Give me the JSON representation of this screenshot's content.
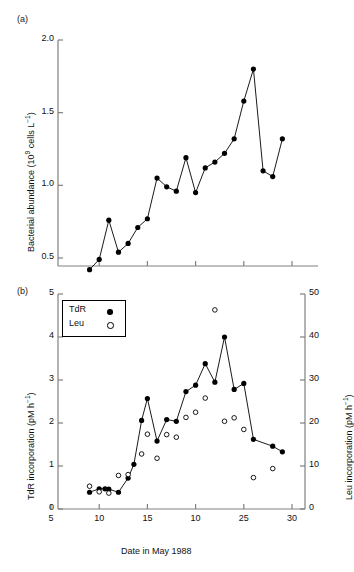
{
  "figure": {
    "panels": [
      {
        "id": "a",
        "label": "(a)"
      },
      {
        "id": "b",
        "label": "(b)"
      }
    ]
  },
  "panel_a": {
    "label": "(a)",
    "ylabel_main": "Bacterial abundance (10",
    "ylabel_exp": "9",
    "ylabel_tail": " cells L",
    "ylabel_tail_exp": "−1",
    "ylabel_close": ")",
    "yticks": [
      "0.5",
      "1.0",
      "1.5",
      "2.0"
    ]
  },
  "panel_b": {
    "label": "(b)",
    "ylabel_left_main": "TdR incorporation (pM h",
    "ylabel_left_exp": "−1",
    "ylabel_left_close": ")",
    "ylabel_right_main": "Leu incorporation (pM h",
    "ylabel_right_exp": "−1",
    "ylabel_right_close": ")",
    "xlabel": "Date in May 1988",
    "yticks_left": [
      "0",
      "1",
      "2",
      "3",
      "4",
      "5"
    ],
    "yticks_right": [
      "0",
      "10",
      "20",
      "30",
      "40",
      "50"
    ],
    "xticks": [
      "5",
      "10",
      "15",
      "10",
      "25",
      "30"
    ],
    "legend": {
      "entries": [
        {
          "label": "TdR",
          "marker": "filled-circle"
        },
        {
          "label": "Leu",
          "marker": "open-circle"
        }
      ]
    }
  },
  "chart_data": [
    {
      "type": "line",
      "panel": "a",
      "title": "",
      "xlabel": "",
      "ylabel": "Bacterial abundance (10^9 cells L^-1)",
      "xlim": [
        5,
        31
      ],
      "ylim": [
        0.38,
        2.0
      ],
      "yticks": [
        0.5,
        1.0,
        1.5,
        2.0
      ],
      "grid": false,
      "legend": "none",
      "marker": "filled-circle",
      "series": [
        {
          "name": "Bacterial abundance",
          "x": [
            9,
            10,
            11,
            12,
            13,
            14,
            15,
            16,
            17,
            18,
            19,
            20,
            21,
            22,
            23,
            24,
            25,
            26,
            27,
            28,
            29,
            30
          ],
          "y": [
            0.42,
            0.49,
            0.76,
            0.54,
            0.6,
            0.71,
            0.77,
            1.05,
            0.99,
            0.96,
            1.19,
            0.95,
            1.12,
            1.16,
            1.22,
            1.32,
            1.58,
            1.8,
            1.1,
            1.06,
            1.32
          ]
        }
      ]
    },
    {
      "type": "line",
      "panel": "b",
      "title": "",
      "xlabel": "Date in May 1988",
      "ylabel": "TdR incorporation (pM h^-1)",
      "ylabel_right": "Leu incorporation (pM h^-1)",
      "xlim": [
        5,
        31
      ],
      "ylim": [
        0,
        5
      ],
      "ylim_right": [
        0,
        50
      ],
      "yticks": [
        0,
        1,
        2,
        3,
        4,
        5
      ],
      "yticks_right": [
        0,
        10,
        20,
        30,
        40,
        50
      ],
      "xticks": [
        5,
        10,
        15,
        20,
        25,
        30
      ],
      "grid": false,
      "legend": "upper-left",
      "series": [
        {
          "name": "TdR",
          "marker": "filled-circle",
          "line": true,
          "axis": "left",
          "x": [
            9,
            10,
            10.6,
            11,
            12,
            13,
            13.6,
            14.4,
            15,
            16,
            17,
            18,
            19,
            20,
            21,
            22,
            23,
            24,
            25,
            26,
            28,
            29,
            30
          ],
          "y": [
            0.39,
            0.47,
            0.47,
            0.46,
            0.39,
            0.72,
            1.04,
            2.06,
            2.57,
            1.58,
            2.08,
            2.04,
            2.73,
            2.88,
            3.38,
            2.95,
            4.0,
            2.78,
            2.92,
            1.62,
            1.46,
            1.33
          ]
        },
        {
          "name": "Leu",
          "marker": "open-circle",
          "line": false,
          "axis": "right",
          "x": [
            9,
            10,
            11,
            12,
            13,
            14.4,
            15,
            16,
            17,
            18,
            19,
            20,
            21,
            22,
            23,
            24,
            25,
            26,
            28,
            30
          ],
          "y": [
            5.3,
            4.0,
            3.7,
            7.8,
            8.0,
            12.8,
            17.4,
            11.8,
            17.3,
            16.7,
            21.3,
            22.5,
            25.8,
            46.3,
            20.4,
            21.2,
            18.5,
            7.3,
            9.4
          ]
        }
      ]
    }
  ]
}
